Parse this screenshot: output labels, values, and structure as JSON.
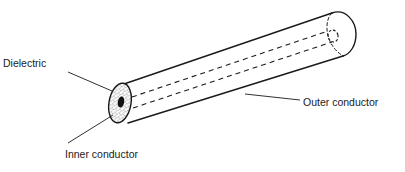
{
  "diagram": {
    "labels": {
      "dielectric": "Dielectric",
      "inner_conductor": "Inner conductor",
      "outer_conductor": "Outer conductor"
    },
    "colors": {
      "line": "#1a1a1a",
      "background": "#ffffff",
      "dielectric_fill": "#d8d8d8",
      "inner_conductor_fill": "#111111"
    }
  }
}
